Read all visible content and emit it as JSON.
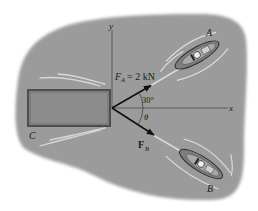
{
  "diagram": {
    "type": "force-diagram",
    "colors": {
      "background": "#ffffff",
      "water": "#9b9b9b",
      "barge_fill": "#8a8a8a",
      "barge_edge": "#4a4a4a",
      "axis": "#555555",
      "arrow": "#111111",
      "wake": "#e4e4e4"
    },
    "axes": {
      "x_label": "x",
      "y_label": "y"
    },
    "labels": {
      "barge": "C",
      "boat_a": "A",
      "boat_b": "B",
      "force_a_symbol": "F",
      "force_a_sub": "A",
      "force_a_value": "= 2 kN",
      "force_b_symbol": "F",
      "force_b_sub": "B",
      "angle_a": "30°",
      "angle_b": "θ"
    },
    "forces": [
      {
        "name": "F_A",
        "magnitude": "2 kN",
        "angle_from_x_deg": 30,
        "direction": "above x-axis"
      },
      {
        "name": "F_B",
        "magnitude": "unknown",
        "angle_from_x": "θ",
        "direction": "below x-axis"
      }
    ]
  }
}
